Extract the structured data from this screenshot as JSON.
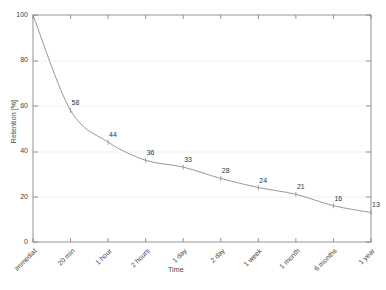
{
  "chart_data": {
    "type": "line",
    "title": "",
    "xlabel": "Time",
    "ylabel": "Retention [%]",
    "categories": [
      "immediat",
      "20 min",
      "1 hour",
      "2 hours",
      "1 day",
      "2 day",
      "1 week",
      "1 month",
      "6 months",
      "1 year"
    ],
    "values": [
      100,
      58,
      44,
      36,
      33,
      28,
      24,
      21,
      16,
      13
    ],
    "point_labels": [
      "",
      "58",
      "44",
      "36",
      "33",
      "28",
      "24",
      "21",
      "16",
      "13"
    ],
    "ylim": [
      0,
      100
    ],
    "yticks": [
      0,
      20,
      40,
      60,
      80,
      100
    ],
    "ytick_labels": [
      "0",
      "20",
      "40",
      "60",
      "80",
      "100"
    ],
    "grid": "horizontal",
    "legend": "none",
    "line_color": "#8c8c8c",
    "grid_color": "#e6e6e6",
    "axis_color": "#7a7a7a",
    "text_color": "#444444",
    "background": "#ffffff"
  }
}
